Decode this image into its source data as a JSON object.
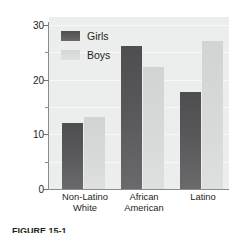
{
  "chart_data": {
    "type": "bar",
    "title": "",
    "xlabel": "",
    "ylabel_line_1": "Percent of overweight 11- to 14-year-",
    "ylabel_line_2": "olds in the United States",
    "categories": [
      "Non-Latino White",
      "African American",
      "Latino"
    ],
    "category_lines": [
      [
        "Non-Latino",
        "White"
      ],
      [
        "African",
        "American"
      ],
      [
        "Latino",
        ""
      ]
    ],
    "series": [
      {
        "name": "Girls",
        "values": [
          12.0,
          26.2,
          17.7
        ],
        "color": "#58585a"
      },
      {
        "name": "Boys",
        "values": [
          13.2,
          22.3,
          27.0
        ],
        "color": "#d8d9d9"
      }
    ],
    "ylim": [
      0,
      32
    ],
    "yticks_major": [
      0,
      10,
      20,
      30
    ],
    "ytick_labels": [
      "0",
      "10",
      "20",
      "30"
    ],
    "yticks_minor": [
      5,
      15,
      25
    ],
    "grid": true,
    "grid_axis": "y",
    "legend_position": "upper-left-inside",
    "plot_background": "#eceded"
  },
  "legend": {
    "items": [
      {
        "label": "Girls"
      },
      {
        "label": "Boys"
      }
    ]
  },
  "caption": {
    "text": "FIGURE 15-1"
  }
}
